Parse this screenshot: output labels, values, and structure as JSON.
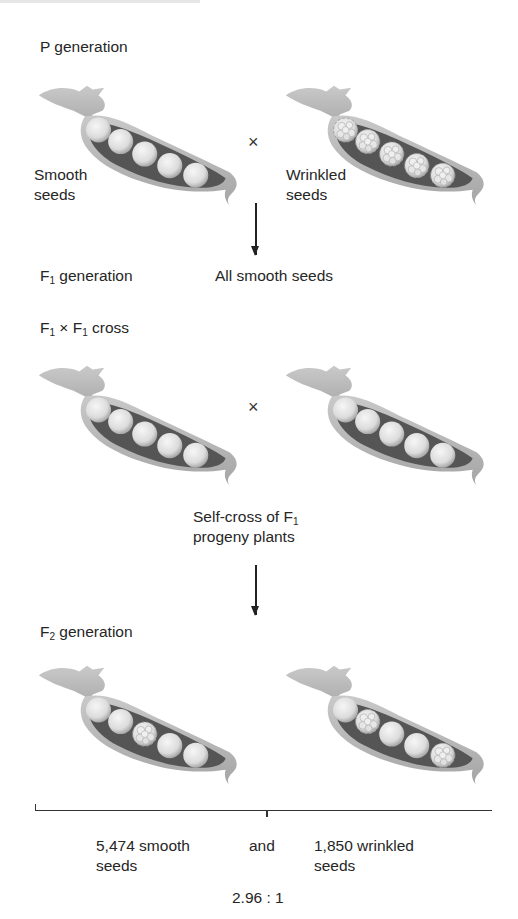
{
  "p_generation": {
    "label": "P generation",
    "left_pod": {
      "seed_type": "smooth",
      "label_line1": "Smooth",
      "label_line2": "seeds",
      "seeds": [
        "smooth",
        "smooth",
        "smooth",
        "smooth",
        "smooth"
      ]
    },
    "cross_symbol": "×",
    "right_pod": {
      "seed_type": "wrinkled",
      "label_line1": "Wrinkled",
      "label_line2": "seeds",
      "seeds": [
        "wrinkled",
        "wrinkled",
        "wrinkled",
        "wrinkled",
        "wrinkled"
      ]
    }
  },
  "f1_generation": {
    "label_main": "F",
    "label_sub": "1",
    "label_rest": " generation",
    "result": "All smooth seeds"
  },
  "f1_cross": {
    "label_f": "F",
    "label_sub1": "1",
    "label_times": " × ",
    "label_f2": "F",
    "label_sub2": "1",
    "label_rest": " cross",
    "cross_symbol": "×",
    "left_pod": {
      "seeds": [
        "smooth",
        "smooth",
        "smooth",
        "smooth",
        "smooth"
      ]
    },
    "right_pod": {
      "seeds": [
        "smooth",
        "smooth",
        "smooth",
        "smooth",
        "smooth"
      ]
    },
    "caption_line1": "Self-cross of F",
    "caption_sub": "1",
    "caption_line2": "progeny plants"
  },
  "f2_generation": {
    "label_main": "F",
    "label_sub": "2",
    "label_rest": " generation",
    "left_pod": {
      "seeds": [
        "smooth",
        "smooth",
        "wrinkled",
        "smooth",
        "smooth"
      ]
    },
    "right_pod": {
      "seeds": [
        "smooth",
        "wrinkled",
        "smooth",
        "smooth",
        "wrinkled"
      ]
    }
  },
  "results": {
    "smooth_line1": "5,474 smooth",
    "smooth_line2": "seeds",
    "conjunction": "and",
    "wrinkled_line1": "1,850 wrinkled",
    "wrinkled_line2": "seeds",
    "ratio": "2.96 : 1",
    "smooth_count": 5474,
    "wrinkled_count": 1850
  },
  "colors": {
    "pod_fill": "#b8b8b8",
    "pod_inner": "#5a5a5a",
    "seed": "#e2e2e2",
    "text": "#262626"
  }
}
